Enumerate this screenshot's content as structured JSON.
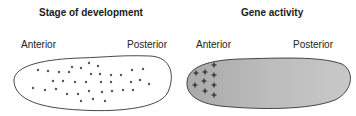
{
  "panels": [
    {
      "title": "Stage of development",
      "left_label": "Anterior",
      "right_label": "Posterior",
      "fill": "#ffffff",
      "marker": "dot",
      "markers": [
        [
          38,
          70
        ],
        [
          48,
          71
        ],
        [
          59,
          72
        ],
        [
          69,
          72
        ],
        [
          72,
          67
        ],
        [
          81,
          68
        ],
        [
          89,
          63
        ],
        [
          98,
          66
        ],
        [
          91,
          74
        ],
        [
          100,
          74
        ],
        [
          111,
          75
        ],
        [
          121,
          75
        ],
        [
          132,
          70
        ],
        [
          143,
          69
        ],
        [
          53,
          81
        ],
        [
          63,
          81
        ],
        [
          75,
          82
        ],
        [
          86,
          82
        ],
        [
          101,
          82
        ],
        [
          111,
          82
        ],
        [
          131,
          82
        ],
        [
          140,
          80
        ],
        [
          149,
          84
        ],
        [
          33,
          88
        ],
        [
          45,
          90
        ],
        [
          56,
          89
        ],
        [
          67,
          94
        ],
        [
          78,
          94
        ],
        [
          89,
          91
        ],
        [
          102,
          92
        ],
        [
          112,
          91
        ],
        [
          123,
          90
        ],
        [
          133,
          90
        ],
        [
          81,
          101
        ],
        [
          93,
          99
        ],
        [
          105,
          101
        ]
      ]
    },
    {
      "title": "Gene activity",
      "left_label": "Anterior",
      "right_label": "Posterior",
      "fill": "#b4b4b4",
      "marker": "plus",
      "markers": [
        [
          214,
          65
        ],
        [
          196,
          73
        ],
        [
          205,
          72
        ],
        [
          214,
          75
        ],
        [
          195,
          85
        ],
        [
          204,
          81
        ],
        [
          214,
          85
        ],
        [
          205,
          91
        ],
        [
          214,
          95
        ]
      ]
    }
  ],
  "colors": {
    "outline": "#333333",
    "dot": "#555555",
    "plus": "#1a1a1a",
    "gradient_light": "#d2d2d2",
    "gradient_dark": "#a9a9a9"
  }
}
